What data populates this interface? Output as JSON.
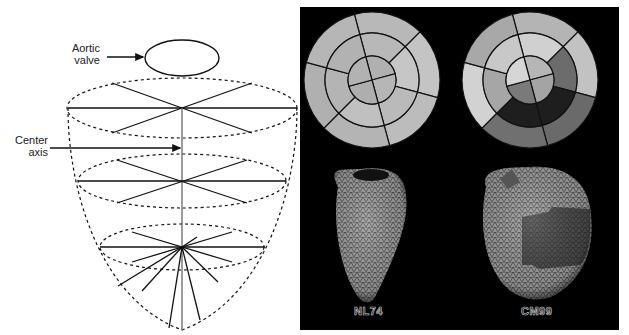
{
  "left_diagram": {
    "labels": {
      "aortic_valve_line1": "Aortic",
      "aortic_valve_line2": "valve",
      "center_axis_line1": "Center",
      "center_axis_line2": "axis"
    },
    "levels": [
      "base",
      "mid",
      "apex"
    ],
    "stroke_color": "#111111"
  },
  "right_panel": {
    "background": "#000000",
    "bullseyes": [
      {
        "id": "NL74",
        "rings": {
          "outer": [
            "#b8b8b8",
            "#c4c4c4",
            "#bcbcbc",
            "#b4b4b4",
            "#b0b0b0",
            "#b6b6b6"
          ],
          "middle": [
            "#b8b8b8",
            "#c6c6c6",
            "#bababa",
            "#c0c0c0",
            "#b4b4b4",
            "#b2b2b2"
          ],
          "inner": [
            "#b0b0b0",
            "#b6b6b6",
            "#aeaeae",
            "#b2b2b2"
          ]
        }
      },
      {
        "id": "CM99",
        "rings": {
          "outer": [
            "#b4b4b4",
            "#c2c2c2",
            "#6a6a6a",
            "#707070",
            "#d2d2d2",
            "#a8a8a8"
          ],
          "middle": [
            "#d0d0d0",
            "#6c6c6c",
            "#1e1e1e",
            "#1e1e1e",
            "#a6a6a6",
            "#c8c8c8"
          ],
          "inner": [
            "#b6b6b6",
            "#a4a4a4",
            "#7a7a7a",
            "#d6d6d6"
          ]
        }
      }
    ],
    "captions": [
      "NL74",
      "CM99"
    ]
  }
}
